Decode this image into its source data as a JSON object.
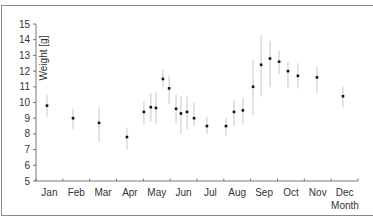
{
  "chart_data": {
    "type": "scatter",
    "title": "",
    "xlabel": "Month",
    "ylabel": "Weight [g]",
    "ylim": [
      5,
      15
    ],
    "xlim": [
      0,
      12
    ],
    "yticks": [
      5,
      6,
      7,
      8,
      9,
      10,
      11,
      12,
      13,
      14,
      15
    ],
    "xtick_labels": [
      "Jan",
      "Feb",
      "Mar",
      "Apr",
      "May",
      "Jun",
      "Jul",
      "Aug",
      "Sep",
      "Oct",
      "Nov",
      "Dec"
    ],
    "grid": false,
    "legend": null,
    "series": [
      {
        "name": "Weight",
        "error_bars": true,
        "points": [
          {
            "x": 0.41,
            "y": 9.8,
            "low": 9.1,
            "high": 10.5
          },
          {
            "x": 1.38,
            "y": 9.0,
            "low": 8.3,
            "high": 9.6
          },
          {
            "x": 2.35,
            "y": 8.7,
            "low": 7.5,
            "high": 9.7
          },
          {
            "x": 3.39,
            "y": 7.8,
            "low": 7.0,
            "high": 8.4
          },
          {
            "x": 4.02,
            "y": 9.4,
            "low": 8.6,
            "high": 10.1
          },
          {
            "x": 4.28,
            "y": 9.7,
            "low": 8.8,
            "high": 10.6
          },
          {
            "x": 4.47,
            "y": 9.65,
            "low": 8.6,
            "high": 10.7
          },
          {
            "x": 4.73,
            "y": 11.5,
            "low": 11.0,
            "high": 12.1
          },
          {
            "x": 4.96,
            "y": 10.9,
            "low": 9.9,
            "high": 11.7
          },
          {
            "x": 5.22,
            "y": 9.6,
            "low": 8.7,
            "high": 10.5
          },
          {
            "x": 5.4,
            "y": 9.3,
            "low": 8.0,
            "high": 10.4
          },
          {
            "x": 5.63,
            "y": 9.4,
            "low": 8.3,
            "high": 10.4
          },
          {
            "x": 5.89,
            "y": 9.0,
            "low": 8.5,
            "high": 10.0
          },
          {
            "x": 6.37,
            "y": 8.5,
            "low": 8.0,
            "high": 9.1
          },
          {
            "x": 7.08,
            "y": 8.5,
            "low": 7.9,
            "high": 9.0
          },
          {
            "x": 7.38,
            "y": 9.4,
            "low": 8.5,
            "high": 10.2
          },
          {
            "x": 7.71,
            "y": 9.5,
            "low": 8.6,
            "high": 10.3
          },
          {
            "x": 8.09,
            "y": 11.0,
            "low": 9.2,
            "high": 12.7
          },
          {
            "x": 8.39,
            "y": 12.4,
            "low": 10.4,
            "high": 14.3
          },
          {
            "x": 8.72,
            "y": 12.8,
            "low": 11.0,
            "high": 13.9
          },
          {
            "x": 9.06,
            "y": 12.6,
            "low": 11.8,
            "high": 13.3
          },
          {
            "x": 9.39,
            "y": 12.0,
            "low": 10.9,
            "high": 12.6
          },
          {
            "x": 9.76,
            "y": 11.7,
            "low": 10.9,
            "high": 12.5
          },
          {
            "x": 10.47,
            "y": 11.6,
            "low": 10.6,
            "high": 12.3
          },
          {
            "x": 11.44,
            "y": 10.4,
            "low": 9.7,
            "high": 11.0
          }
        ]
      }
    ]
  }
}
